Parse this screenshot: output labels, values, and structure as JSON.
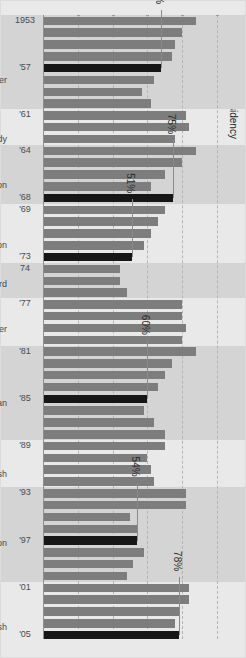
{
  "legend": {
    "label": "Fifth year of presidency",
    "swatch_color": "#161616",
    "swatch_name": "black-square-swatch"
  },
  "colors": {
    "bar": "#7d7d7d",
    "bar_highlight": "#161616",
    "figure_background": "#e9e9e9",
    "band_shade": "#d4d4d4",
    "grid": "#b4b4b4",
    "text": "#4a4a4a"
  },
  "annotations": [
    {
      "label": "78%",
      "year": "2005"
    },
    {
      "label": "54%",
      "year": "1997"
    },
    {
      "label": "60%",
      "year": "1985"
    },
    {
      "label": "51%",
      "year": "1973"
    },
    {
      "label": "75%",
      "year": "1968"
    },
    {
      "label": "68%",
      "year": "1957"
    }
  ],
  "presidents": [
    {
      "name": "Eisenhower",
      "start": 1953,
      "end": 1960
    },
    {
      "name": "Kennedy",
      "start": 1961,
      "end": 1963
    },
    {
      "name": "Johnson",
      "start": 1964,
      "end": 1968
    },
    {
      "name": "Nixon",
      "start": 1969,
      "end": 1974
    },
    {
      "name": "Ford",
      "start": 1974,
      "end": 1976
    },
    {
      "name": "Carter",
      "start": 1977,
      "end": 1980
    },
    {
      "name": "Reagan",
      "start": 1981,
      "end": 1988
    },
    {
      "name": "G. Bush",
      "start": 1989,
      "end": 1992
    },
    {
      "name": "Clinton",
      "start": 1993,
      "end": 2000
    },
    {
      "name": "G.W. Bush",
      "start": 2001,
      "end": 2006
    }
  ],
  "year_tick_labels": [
    "1953",
    "'57",
    "'61",
    "'64",
    "'68",
    "'69",
    "'73",
    "74",
    "'77",
    "'81",
    "'85",
    "'89",
    "'93",
    "'97",
    "'01",
    "'05"
  ],
  "chart_data": {
    "type": "bar",
    "title": "",
    "xlabel": "",
    "ylabel": "",
    "orientation": "horizontal-rotated",
    "xlim": [
      0,
      100
    ],
    "grid": true,
    "legend": [
      "Fifth year of presidency"
    ],
    "value_gridlines": [
      20,
      40,
      60,
      80,
      100
    ],
    "categories": [
      "1953",
      "1954",
      "1955",
      "1956",
      "1957",
      "1958",
      "1959",
      "1960",
      "1961",
      "1962",
      "1963",
      "1964",
      "1965",
      "1966",
      "1967",
      "1968",
      "1969",
      "1970",
      "1971",
      "1972",
      "1973",
      "1974",
      "1975",
      "1976",
      "1977",
      "1978",
      "1979",
      "1980",
      "1981",
      "1982",
      "1983",
      "1984",
      "1985",
      "1986",
      "1987",
      "1988",
      "1989",
      "1990",
      "1991",
      "1992",
      "1993",
      "1994",
      "1995",
      "1996",
      "1997",
      "1998",
      "1999",
      "2000",
      "2001",
      "2002",
      "2003",
      "2004",
      "2005"
    ],
    "values": [
      88,
      80,
      76,
      74,
      68,
      64,
      57,
      62,
      82,
      84,
      76,
      88,
      80,
      70,
      62,
      75,
      70,
      66,
      62,
      58,
      51,
      44,
      44,
      48,
      80,
      80,
      82,
      80,
      88,
      74,
      70,
      66,
      60,
      58,
      64,
      70,
      70,
      60,
      62,
      64,
      82,
      82,
      50,
      54,
      54,
      58,
      52,
      48,
      84,
      84,
      78,
      76,
      78
    ],
    "highlighted_categories": [
      "1957",
      "1968",
      "1973",
      "1985",
      "1997",
      "2005"
    ],
    "data_labels": {
      "1957": "68%",
      "1968": "75%",
      "1973": "51%",
      "1985": "60%",
      "1997": "54%",
      "2005": "78%"
    }
  }
}
